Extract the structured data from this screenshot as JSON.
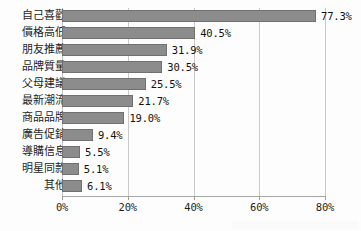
{
  "chart_data": {
    "type": "bar",
    "orientation": "horizontal",
    "title": "",
    "xlabel": "",
    "ylabel": "",
    "xlim": [
      0,
      80
    ],
    "grid": true,
    "legend": "none",
    "categories": [
      "自己喜歡",
      "價格高低",
      "朋友推薦",
      "品牌質量",
      "父母建議",
      "最新潮流",
      "商品品牌",
      "廣告促銷",
      "導購信息",
      "明星同款",
      "其他"
    ],
    "values": [
      77.3,
      40.5,
      31.9,
      30.5,
      25.5,
      21.7,
      19.0,
      9.4,
      5.5,
      5.1,
      6.1
    ],
    "value_labels": [
      "77.3%",
      "40.5%",
      "31.9%",
      "30.5%",
      "25.5%",
      "21.7%",
      "19.0%",
      "9.4%",
      "5.5%",
      "5.1%",
      "6.1%"
    ],
    "xticks": [
      0,
      20,
      40,
      60,
      80
    ],
    "xtick_labels": [
      "0%",
      "20%",
      "40%",
      "60%",
      "80%"
    ],
    "colors": {
      "bar_fill": "#8c8c8c",
      "bar_border": "#707070",
      "grid": "#c9c9c9",
      "axis": "#a6a6a6",
      "text": "#1d1d1d",
      "background": "#fdfdfd"
    }
  }
}
